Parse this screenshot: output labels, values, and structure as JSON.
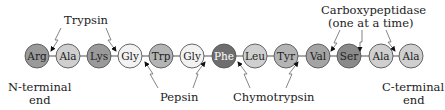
{
  "diagram": {
    "residues": [
      {
        "name": "Arg",
        "fill": "#9a9a9a",
        "text": "#222222"
      },
      {
        "name": "Ala",
        "fill": "#cfcfcf",
        "text": "#222222"
      },
      {
        "name": "Lys",
        "fill": "#9a9a9a",
        "text": "#222222"
      },
      {
        "name": "Gly",
        "fill": "#f2f2f2",
        "text": "#222222"
      },
      {
        "name": "Trp",
        "fill": "#b4b4b4",
        "text": "#222222"
      },
      {
        "name": "Gly",
        "fill": "#f2f2f2",
        "text": "#222222"
      },
      {
        "name": "Phe",
        "fill": "#6e6e6e",
        "text": "#ffffff"
      },
      {
        "name": "Leu",
        "fill": "#cfcfcf",
        "text": "#222222"
      },
      {
        "name": "Tyr",
        "fill": "#b4b4b4",
        "text": "#222222"
      },
      {
        "name": "Val",
        "fill": "#a4a4a4",
        "text": "#222222"
      },
      {
        "name": "Ser",
        "fill": "#8a8a8a",
        "text": "#222222"
      },
      {
        "name": "Ala",
        "fill": "#cfcfcf",
        "text": "#222222"
      },
      {
        "name": "Ala",
        "fill": "#cfcfcf",
        "text": "#222222"
      }
    ],
    "enzymes": {
      "trypsin": "Trypsin",
      "pepsin": "Pepsin",
      "chymotrypsin": "Chymotrypsin",
      "carboxypeptidase_line1": "Carboxypeptidase",
      "carboxypeptidase_line2": "(one at a time)"
    },
    "ends": {
      "n_line1": "N-terminal",
      "n_line2": "end",
      "c_line1": "C-terminal",
      "c_line2": "end"
    }
  }
}
